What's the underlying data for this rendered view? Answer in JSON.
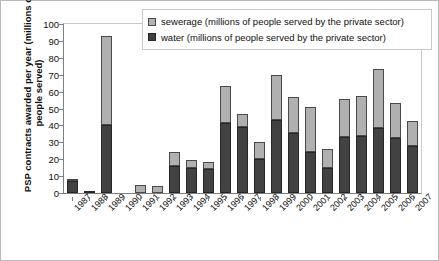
{
  "chart_data": {
    "type": "bar",
    "stacked": true,
    "title": "",
    "xlabel": "",
    "ylabel": "PSP contracts awarded per year (millions of people served)",
    "ylim": [
      0,
      100
    ],
    "yticks": [
      0,
      10,
      20,
      30,
      40,
      50,
      60,
      70,
      80,
      90,
      100
    ],
    "grid": false,
    "legend_position": "top-right",
    "categories": [
      "1987",
      "1988",
      "1989",
      "1990",
      "1991",
      "1992",
      "1993",
      "1994",
      "1995",
      "1996",
      "1997",
      "1998",
      "1999",
      "2000",
      "2001",
      "2002",
      "2003",
      "2004",
      "2005",
      "2006",
      "2007"
    ],
    "series": [
      {
        "name": "water (millions of people served by the private sector)",
        "color": "#424242",
        "values": [
          7.0,
          0.5,
          40.5,
          0.0,
          0.0,
          0.0,
          16.0,
          15.0,
          14.5,
          41.5,
          39.0,
          20.0,
          43.5,
          35.5,
          24.5,
          15.0,
          33.0,
          34.0,
          38.5,
          32.5,
          28.0
        ]
      },
      {
        "name": "sewerage (millions of people served by the private sector)",
        "color": "#b0b0b0",
        "values": [
          1.5,
          0.0,
          52.5,
          0.0,
          5.0,
          4.0,
          8.0,
          4.5,
          4.0,
          22.0,
          8.0,
          10.0,
          26.5,
          21.5,
          26.5,
          11.0,
          22.5,
          23.5,
          35.0,
          21.0,
          14.5
        ]
      }
    ],
    "totals": [
      8.5,
      0.5,
      93.0,
      0.0,
      5.0,
      4.0,
      24.0,
      19.5,
      18.5,
      63.5,
      47.0,
      30.0,
      70.0,
      57.0,
      51.0,
      26.0,
      55.5,
      57.5,
      73.5,
      53.5,
      42.5
    ]
  },
  "legend": {
    "items": [
      {
        "label": "sewerage (millions of people served by the private sector)",
        "icon": "square-swatch-light"
      },
      {
        "label": "water (millions of people served by the private sector)",
        "icon": "square-swatch-dark"
      }
    ]
  }
}
